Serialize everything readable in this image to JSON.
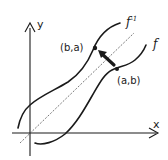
{
  "diagram": {
    "type": "inverse-function-reflection",
    "axes": {
      "x_label": "x",
      "y_label": "y"
    },
    "curves": [
      {
        "name": "f",
        "label": "f"
      },
      {
        "name": "f-inverse",
        "label_base": "f",
        "label_sup": "-1"
      }
    ],
    "reference_line": "y = x",
    "points": [
      {
        "label": "(b,a)",
        "on": "f-inverse"
      },
      {
        "label": "(a,b)",
        "on": "f"
      }
    ],
    "arrow": {
      "from": "(a,b)",
      "to": "(b,a)",
      "meaning": "reflection across y = x"
    },
    "colors": {
      "ink": "#1a1a1a",
      "background": "#ffffff",
      "dashed_line": "#555555"
    }
  }
}
